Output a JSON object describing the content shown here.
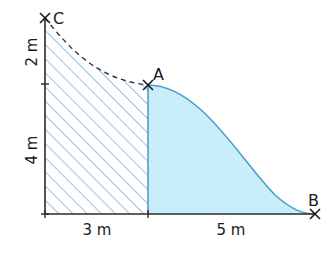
{
  "diagram": {
    "points": {
      "C": {
        "label": "C"
      },
      "A": {
        "label": "A"
      },
      "B": {
        "label": "B"
      }
    },
    "dimensions": {
      "vertical_top": "2 m",
      "vertical_bottom": "4 m",
      "horizontal_left": "3 m",
      "horizontal_right": "5 m"
    },
    "regions": {
      "hatched": "rectangle 3 m × 4 m with dashed curve from C to A",
      "filled": "region under curve from A to B over 5 m"
    },
    "colors": {
      "fill": "#c9eef9",
      "hatch": "#5fa3d4",
      "curve": "#4a9fd0",
      "axis": "#2a2a2a",
      "dashed": "#333333"
    }
  }
}
